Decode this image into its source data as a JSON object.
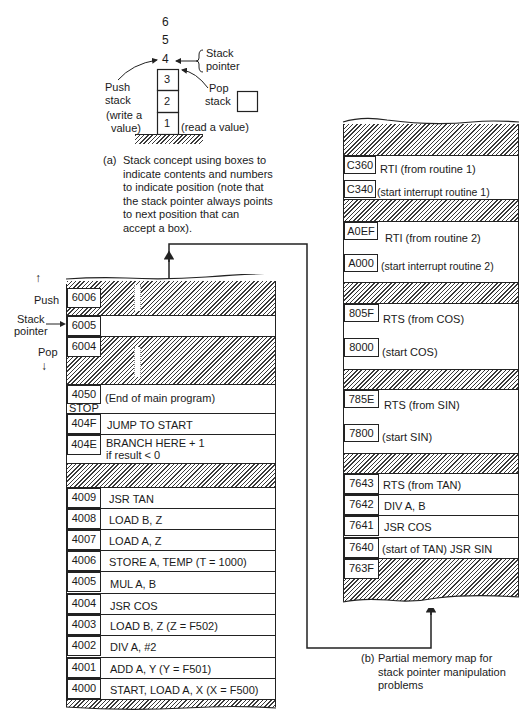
{
  "figure_a": {
    "positions": [
      "6",
      "5",
      "4"
    ],
    "stack_pointer_label": [
      "Stack",
      "pointer"
    ],
    "boxes": [
      "3",
      "2",
      "1"
    ],
    "push_label": [
      "Push",
      "stack",
      "(write a",
      "value)"
    ],
    "pop_label": [
      "Pop",
      "stack"
    ],
    "read_label": "(read a value)",
    "caption_letter": "(a)",
    "caption": [
      "Stack concept using boxes to",
      "indicate contents and numbers",
      "to indicate position (note that",
      "the stack pointer always points",
      "to next position that can",
      "accept a box)."
    ]
  },
  "left_map": {
    "side_labels": {
      "push": "Push",
      "stack_pointer": [
        "Stack",
        "pointer"
      ],
      "pop": "Pop"
    },
    "rows": [
      {
        "addr": "6006",
        "text": "",
        "hatched": true
      },
      {
        "addr": "6005",
        "text": "",
        "hatched": false
      },
      {
        "addr": "6004",
        "text": "",
        "hatched": true
      },
      {
        "addr": "4050",
        "addr2": "STOP",
        "text": "(End of main program)",
        "hatched": false
      },
      {
        "addr": "404F",
        "text": "JUMP TO START",
        "hatched": false
      },
      {
        "addr": "404E",
        "text": "BRANCH HERE + 1",
        "text2": "if result < 0",
        "hatched": false
      },
      {
        "addr": "",
        "text": "",
        "hatched": true
      },
      {
        "addr": "4009",
        "text": "JSR TAN",
        "hatched": false
      },
      {
        "addr": "4008",
        "text": "LOAD B, Z",
        "hatched": false
      },
      {
        "addr": "4007",
        "text": "LOAD A, Z",
        "hatched": false
      },
      {
        "addr": "4006",
        "text": "STORE A, TEMP (T = 1000)",
        "hatched": false
      },
      {
        "addr": "4005",
        "text": "MUL A, B",
        "hatched": false
      },
      {
        "addr": "4004",
        "text": "JSR COS",
        "hatched": false
      },
      {
        "addr": "4003",
        "text": "LOAD B, Z (Z = F502)",
        "hatched": false
      },
      {
        "addr": "4002",
        "text": "DIV A, #2",
        "hatched": false
      },
      {
        "addr": "4001",
        "text": "ADD A, Y (Y = F501)",
        "hatched": false
      },
      {
        "addr": "4000",
        "text": "START, LOAD A, X (X = F500)",
        "hatched": false
      }
    ]
  },
  "right_map": {
    "rows": [
      {
        "addr": "C360",
        "text": "RTI (from routine 1)"
      },
      {
        "addr": "C340",
        "text": "(start interrupt routine 1)"
      },
      {
        "addr": "A0EF",
        "text": "RTI (from routine 2)"
      },
      {
        "addr": "A000",
        "text": "(start interrupt routine 2)"
      },
      {
        "addr": "805F",
        "text": "RTS (from COS)"
      },
      {
        "addr": "8000",
        "text": "(start COS)"
      },
      {
        "addr": "785E",
        "text": "RTS (from SIN)"
      },
      {
        "addr": "7800",
        "text": "(start SIN)"
      },
      {
        "addr": "7643",
        "text": "RTS (from TAN)"
      },
      {
        "addr": "7642",
        "text": "DIV A, B"
      },
      {
        "addr": "7641",
        "text": "JSR COS"
      },
      {
        "addr": "7640",
        "text": "(start of TAN) JSR SIN"
      },
      {
        "addr": "763F",
        "text": ""
      }
    ],
    "caption_letter": "(b)",
    "caption": [
      "Partial memory map for",
      "stack pointer manipulation",
      "problems"
    ]
  }
}
